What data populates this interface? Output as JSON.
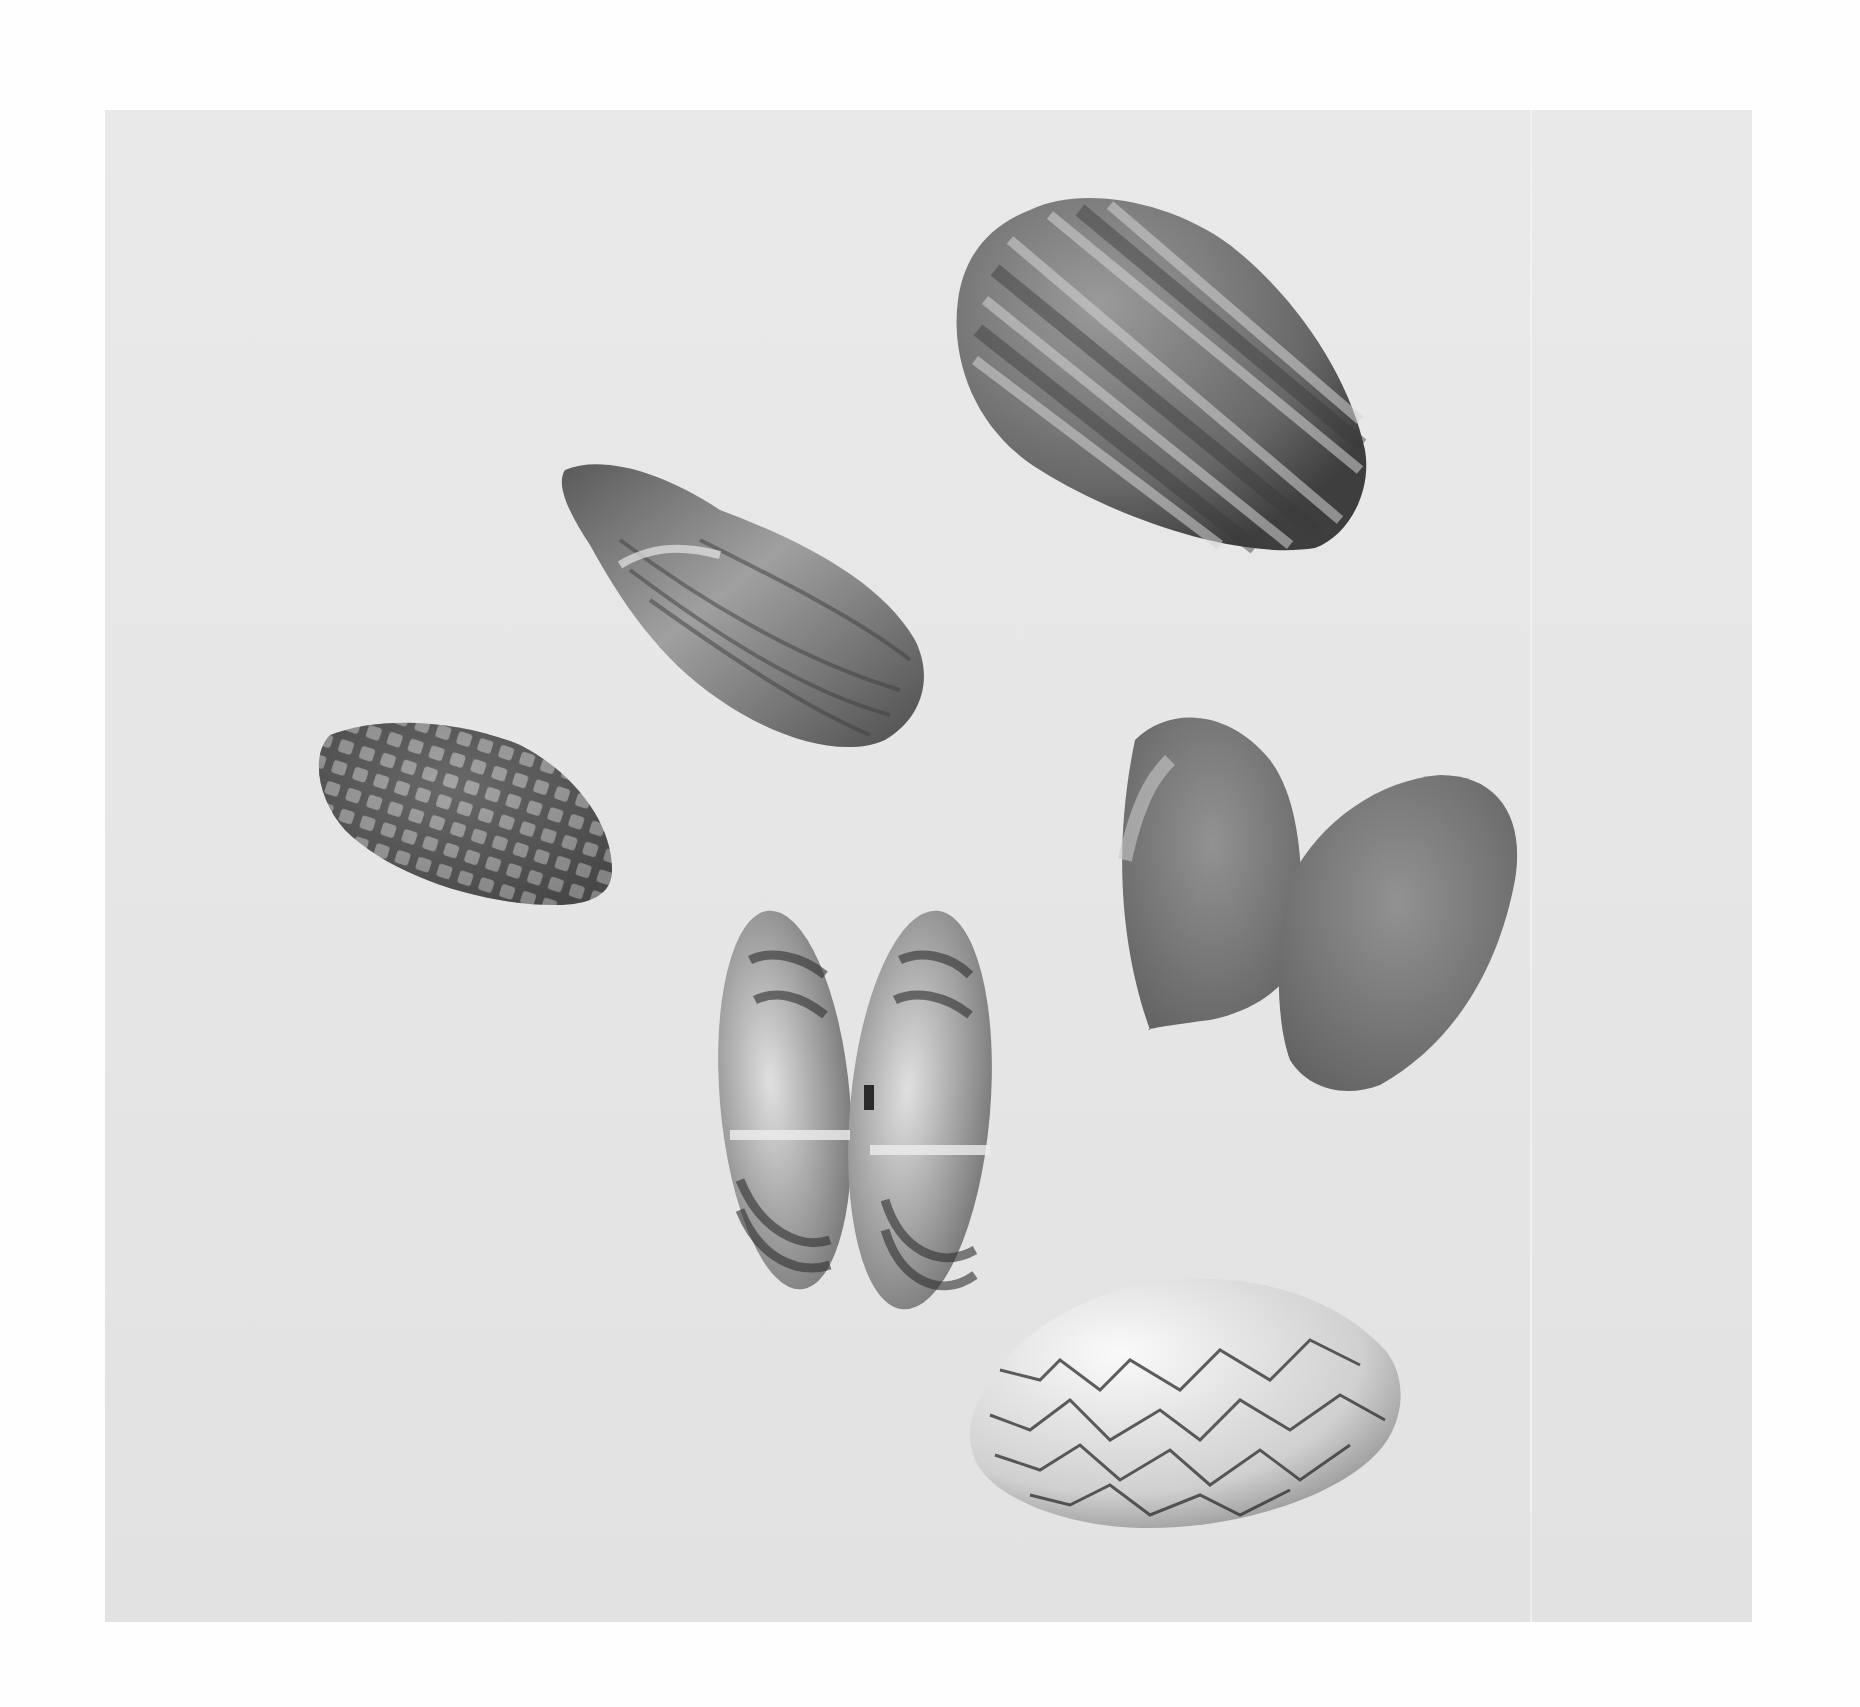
{
  "figure": {
    "type": "photographic-plate",
    "background_color": "#e7e7e7",
    "page_color": "#fefefe",
    "shells": [
      {
        "id": "shell-1",
        "name": "radiating-rayed-clam",
        "pattern": "radial-rays",
        "position": "top-right",
        "tone": "#6a6a6a"
      },
      {
        "id": "shell-2",
        "name": "elongate-mussel-like-shell",
        "pattern": "concentric-bands",
        "position": "upper-center",
        "tone": "#7a7a7a"
      },
      {
        "id": "shell-3",
        "name": "checkered-clam",
        "pattern": "reticulate-checker",
        "position": "left",
        "tone": "#5f5f5f"
      },
      {
        "id": "shell-4",
        "name": "open-bivalve-banded",
        "pattern": "concentric-dark-bands",
        "position": "center",
        "tone": "#8a8a8a"
      },
      {
        "id": "shell-5",
        "name": "open-bivalve-plain",
        "pattern": "smooth",
        "position": "right",
        "tone": "#7c7c7c"
      },
      {
        "id": "shell-6",
        "name": "zigzag-tent-clam",
        "pattern": "zigzag-lines",
        "position": "bottom-right",
        "tone": "#d8d8d8"
      }
    ]
  }
}
